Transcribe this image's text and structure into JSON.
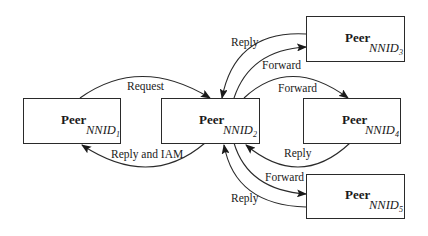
{
  "nodes": [
    {
      "id": "n1",
      "title": "Peer",
      "label": "NNID",
      "sub": "1"
    },
    {
      "id": "n2",
      "title": "Peer",
      "label": "NNID",
      "sub": "2"
    },
    {
      "id": "n3",
      "title": "Peer",
      "label": "NNID",
      "sub": "3"
    },
    {
      "id": "n4",
      "title": "Peer",
      "label": "NNID",
      "sub": "4"
    },
    {
      "id": "n5",
      "title": "Peer",
      "label": "NNID",
      "sub": "5"
    }
  ],
  "edges": [
    {
      "from": "n1",
      "to": "n2",
      "label": "Request"
    },
    {
      "from": "n2",
      "to": "n1",
      "label": "Reply and IAM"
    },
    {
      "from": "n3",
      "to": "n2",
      "label": "Reply"
    },
    {
      "from": "n2",
      "to": "n3",
      "label": "Forward"
    },
    {
      "from": "n2",
      "to": "n4",
      "label": "Forward"
    },
    {
      "from": "n4",
      "to": "n2",
      "label": "Reply"
    },
    {
      "from": "n2",
      "to": "n5",
      "label": "Forward"
    },
    {
      "from": "n5",
      "to": "n2",
      "label": "Reply"
    }
  ],
  "colors": {
    "stroke": "#2a2a2a",
    "background": "#ffffff"
  }
}
